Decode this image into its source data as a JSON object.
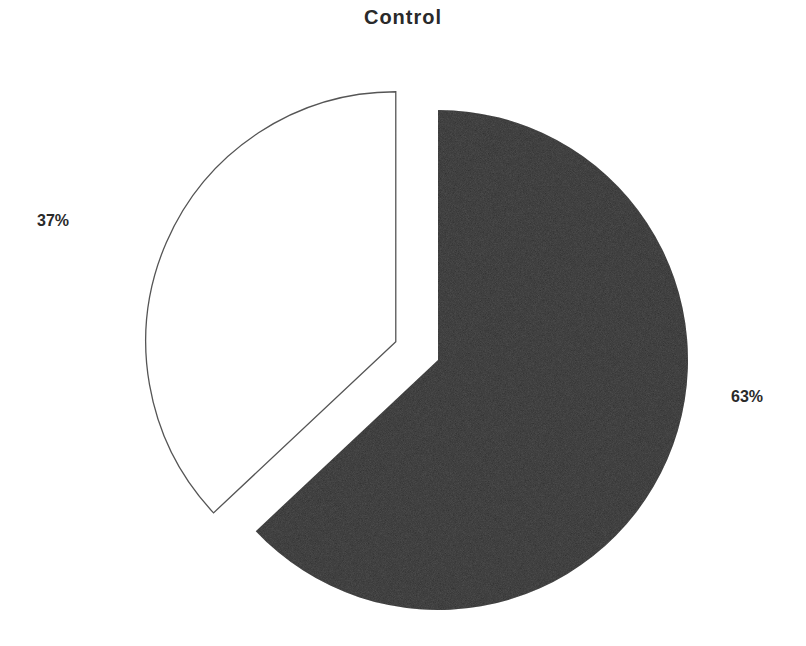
{
  "chart_data": {
    "type": "pie",
    "title": "Control",
    "categories": [
      "Dark slice",
      "White slice"
    ],
    "values": [
      63,
      37
    ],
    "labels": [
      "63%",
      "37%"
    ],
    "colors": [
      "#2b2b2b",
      "#ffffff"
    ],
    "outline_color": "#555555",
    "exploded": [
      false,
      true
    ],
    "start_angle_deg": 0,
    "direction": "clockwise",
    "legend": null
  },
  "labels": {
    "title": "Control",
    "slice_dark_pct": "63%",
    "slice_white_pct": "37%"
  }
}
